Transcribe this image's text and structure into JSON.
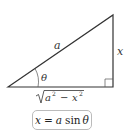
{
  "diagram": {
    "type": "right-triangle",
    "labels": {
      "hypotenuse": "a",
      "opposite": "x",
      "angle": "θ",
      "adjacent_radicand_a": "a",
      "adjacent_radicand_x": "x",
      "adjacent_exponent": "2",
      "adjacent_minus": "−"
    },
    "formula": {
      "lhs": "x",
      "equals": "=",
      "coef": "a",
      "func": "sin",
      "arg": "θ"
    },
    "colors": {
      "line": "#333333",
      "text": "#333333",
      "box_border": "#bbbbbb"
    }
  }
}
